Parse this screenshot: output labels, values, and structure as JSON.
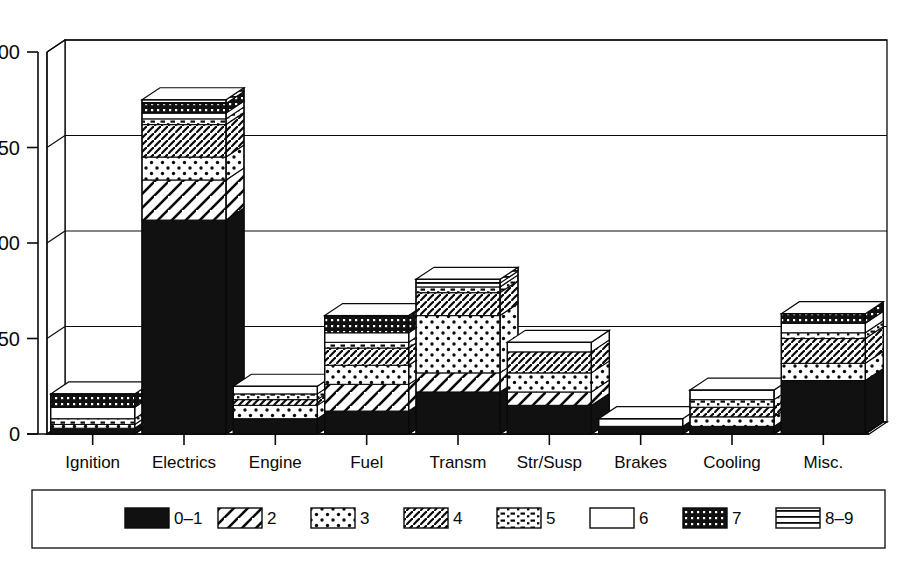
{
  "chart_data": {
    "type": "bar",
    "subtype": "stacked-3d-column",
    "title": "",
    "xlabel": "",
    "ylabel": "",
    "ylim": [
      0,
      200
    ],
    "yticks": [
      0,
      50,
      100,
      150,
      200
    ],
    "ytick_labels": [
      "0",
      "50",
      "100",
      "150",
      "200"
    ],
    "grid": true,
    "grid_orientation": "horizontal",
    "legend_position": "bottom",
    "categories": [
      "Ignition",
      "Electrics",
      "Engine",
      "Fuel",
      "Transm",
      "Str/Susp",
      "Brakes",
      "Cooling",
      "Misc."
    ],
    "series": [
      {
        "name": "0–1",
        "pattern": "solid-black",
        "values": [
          3,
          112,
          8,
          12,
          22,
          15,
          4,
          4,
          28
        ]
      },
      {
        "name": "2",
        "pattern": "diagonal-wide",
        "values": [
          0,
          21,
          0,
          14,
          10,
          7,
          0,
          0,
          0
        ]
      },
      {
        "name": "3",
        "pattern": "dots-sparse",
        "values": [
          2,
          12,
          7,
          10,
          30,
          10,
          0,
          5,
          9
        ]
      },
      {
        "name": "4",
        "pattern": "diagonal-dense",
        "values": [
          0,
          17,
          3,
          9,
          12,
          11,
          0,
          5,
          13
        ]
      },
      {
        "name": "5",
        "pattern": "dashes-dots",
        "values": [
          3,
          3,
          3,
          3,
          3,
          0,
          0,
          4,
          3
        ]
      },
      {
        "name": "6",
        "pattern": "white-empty",
        "values": [
          6,
          3,
          4,
          5,
          2,
          5,
          4,
          5,
          5
        ]
      },
      {
        "name": "7",
        "pattern": "dots-dense-black",
        "values": [
          7,
          5,
          0,
          9,
          0,
          0,
          0,
          0,
          5
        ]
      },
      {
        "name": "8–9",
        "pattern": "horizontal-lines",
        "values": [
          0,
          2,
          0,
          0,
          2,
          0,
          0,
          0,
          0
        ]
      }
    ],
    "totals": [
      21,
      175,
      25,
      62,
      81,
      48,
      8,
      23,
      63
    ]
  },
  "legend": {
    "entries": [
      {
        "label": "0–1",
        "pattern": "solid-black"
      },
      {
        "label": "2",
        "pattern": "diagonal-wide"
      },
      {
        "label": "3",
        "pattern": "dots-sparse"
      },
      {
        "label": "4",
        "pattern": "diagonal-dense"
      },
      {
        "label": "5",
        "pattern": "dashes-dots"
      },
      {
        "label": "6",
        "pattern": "white-empty"
      },
      {
        "label": "7",
        "pattern": "dots-dense-black"
      },
      {
        "label": "8–9",
        "pattern": "horizontal-lines"
      }
    ]
  },
  "colors": {
    "ink": "#0a0a0a",
    "background": "#ffffff",
    "fill_black": "#111111",
    "fill_white": "#ffffff"
  }
}
